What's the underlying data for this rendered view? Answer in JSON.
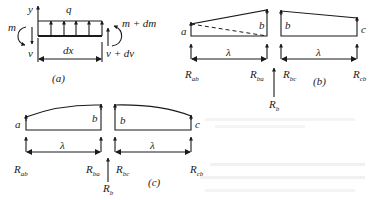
{
  "figure_a": {
    "caption": "(a)",
    "axis_label": "y",
    "load_label": "q",
    "left_moment": "m",
    "left_shear": "v",
    "right_moment": "m + dm",
    "right_shear": "v + dv",
    "length_label": "dx"
  },
  "figure_b": {
    "caption": "(b)",
    "left_span": {
      "start_label": "a",
      "end_label": "b",
      "length_label": "λ",
      "left_reaction": "R",
      "left_reaction_sub": "ab",
      "right_reaction": "R",
      "right_reaction_sub": "ba"
    },
    "right_span": {
      "start_label": "b",
      "end_label": "c",
      "length_label": "λ",
      "left_reaction": "R",
      "left_reaction_sub": "bc",
      "right_reaction": "R",
      "right_reaction_sub": "cb"
    },
    "support_reaction": "R",
    "support_reaction_sub": "b"
  },
  "figure_c": {
    "caption": "(c)",
    "left_span": {
      "start_label": "a",
      "end_label": "b",
      "length_label": "λ",
      "left_reaction": "R",
      "left_reaction_sub": "ab",
      "right_reaction": "R",
      "right_reaction_sub": "ba"
    },
    "right_span": {
      "start_label": "b",
      "end_label": "c",
      "length_label": "λ",
      "left_reaction": "R",
      "left_reaction_sub": "bc",
      "right_reaction": "R",
      "right_reaction_sub": "cb"
    },
    "support_reaction": "R",
    "support_reaction_sub": "b"
  }
}
